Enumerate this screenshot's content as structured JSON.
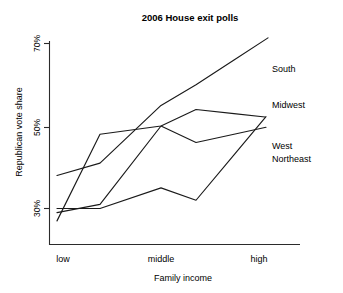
{
  "chart_data": {
    "type": "line",
    "title": "2006 House exit polls",
    "xlabel": "Family income",
    "ylabel": "Republican vote share",
    "grid": false,
    "legend_position": "right-inline-end-of-line",
    "x_tick_labels": [
      "low",
      "middle",
      "high"
    ],
    "x_tick_positions": [
      1,
      3,
      5
    ],
    "x_categories": [
      1,
      2,
      3,
      4,
      5
    ],
    "y_tick_labels": [
      "30%",
      "50%",
      "70%"
    ],
    "y_ticks": [
      30,
      50,
      70
    ],
    "ylim": [
      24,
      72
    ],
    "xlim": [
      0.8,
      5.4
    ],
    "series": [
      {
        "name": "South",
        "label": "South",
        "values": [
          38,
          41,
          55,
          60,
          66
        ],
        "color": "#1a1a1a"
      },
      {
        "name": "Midwest",
        "label": "Midwest",
        "values": [
          27,
          48,
          50,
          54,
          53
        ],
        "color": "#1a1a1a"
      },
      {
        "name": "West",
        "label": "West",
        "values": [
          29,
          31,
          50,
          46,
          48
        ],
        "color": "#1a1a1a"
      },
      {
        "name": "Northeast",
        "label": "Northeast",
        "values": [
          30,
          30,
          35,
          32,
          43
        ],
        "color": "#1a1a1a"
      }
    ]
  },
  "axis": {
    "y_tick_0": "30%",
    "y_tick_1": "50%",
    "y_tick_2": "70%",
    "x_tick_0": "low",
    "x_tick_1": "middle",
    "x_tick_2": "high"
  },
  "labels": {
    "title": "2006 House exit polls",
    "xaxis": "Family income",
    "yaxis": "Republican vote share",
    "south": "South",
    "midwest": "Midwest",
    "west": "West",
    "northeast": "Northeast"
  },
  "colors": {
    "line": "#1a1a1a",
    "axis": "#2b2b2b",
    "background": "#ffffff",
    "text": "#000000"
  }
}
